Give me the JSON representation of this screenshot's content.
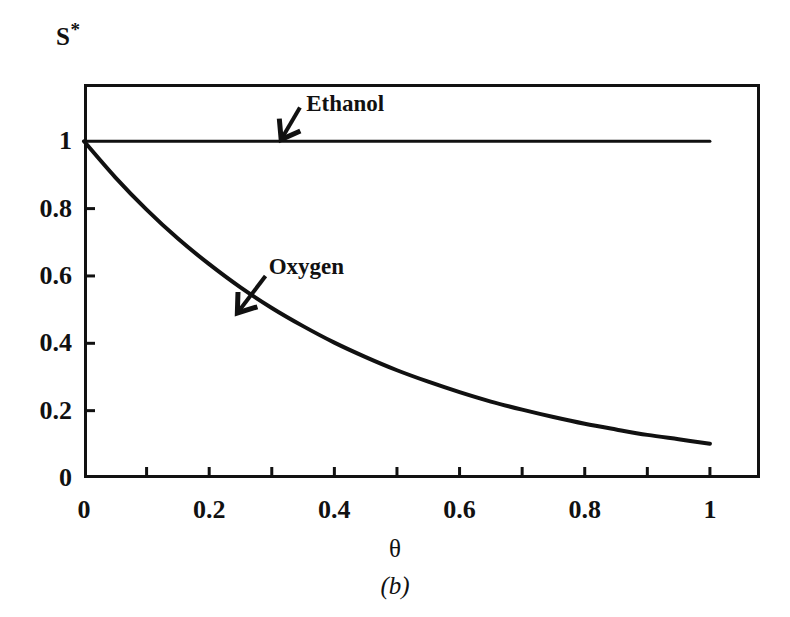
{
  "figure": {
    "y_caption_main": "S",
    "y_caption_star": "*",
    "x_axis_title": "θ",
    "caption": "(b)",
    "line_color": "#111111",
    "background_color": "#ffffff"
  },
  "chart_data": {
    "type": "line",
    "title": "",
    "subtitle": "",
    "xlabel": "θ",
    "ylabel": "S*",
    "caption": "(b)",
    "xlim": [
      0,
      1.08
    ],
    "ylim": [
      0,
      1.17
    ],
    "grid": false,
    "legend_position": "inline-annotations",
    "xticks": [
      0,
      0.2,
      0.4,
      0.6,
      0.8,
      1
    ],
    "xtick_labels": [
      "0",
      "0.2",
      "0.4",
      "0.6",
      "0.8",
      "1"
    ],
    "xminor_ticks": [
      0.1,
      0.3,
      0.5,
      0.7,
      0.9
    ],
    "yticks": [
      0,
      0.2,
      0.4,
      0.6,
      0.8,
      1
    ],
    "ytick_labels": [
      "0",
      "0.2",
      "0.4",
      "0.6",
      "0.8",
      "1"
    ],
    "series": [
      {
        "name": "Ethanol",
        "label": "Ethanol",
        "x": [
          0,
          0.1,
          0.2,
          0.3,
          0.4,
          0.5,
          0.6,
          0.7,
          0.8,
          0.9,
          1.0
        ],
        "values": [
          1,
          1,
          1,
          1,
          1,
          1,
          1,
          1,
          1,
          1,
          1
        ]
      },
      {
        "name": "Oxygen",
        "label": "Oxygen",
        "x": [
          0,
          0.05,
          0.1,
          0.15,
          0.2,
          0.25,
          0.3,
          0.35,
          0.4,
          0.45,
          0.5,
          0.55,
          0.6,
          0.65,
          0.7,
          0.75,
          0.8,
          0.85,
          0.9,
          0.95,
          1.0
        ],
        "values": [
          1.0,
          0.893,
          0.797,
          0.711,
          0.635,
          0.566,
          0.505,
          0.451,
          0.402,
          0.359,
          0.32,
          0.286,
          0.255,
          0.227,
          0.203,
          0.181,
          0.161,
          0.144,
          0.128,
          0.115,
          0.102
        ]
      }
    ],
    "annotations": [
      {
        "name": "Ethanol",
        "text": "Ethanol",
        "text_x": 0.355,
        "text_y": 1.115,
        "arrow_from_x": 0.345,
        "arrow_from_y": 1.1,
        "arrow_to_x": 0.315,
        "arrow_to_y": 1.005
      },
      {
        "name": "Oxygen",
        "text": "Oxygen",
        "text_x": 0.295,
        "text_y": 0.63,
        "arrow_from_x": 0.29,
        "arrow_from_y": 0.6,
        "arrow_to_x": 0.245,
        "arrow_to_y": 0.49
      }
    ]
  }
}
